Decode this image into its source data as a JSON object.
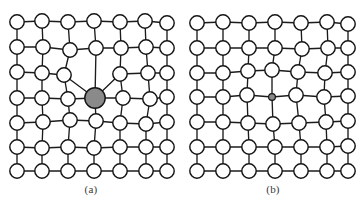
{
  "figure": {
    "background_color": "#ffffff",
    "bond_color": "#1c1c1c",
    "atom_fill_color": "#ffffff",
    "atom_stroke_color": "#141414",
    "impurity_fill_color": "#8a8a8a",
    "caption_color": "#38383c"
  },
  "panels": [
    {
      "id": "a",
      "caption": "(a)",
      "defect_type": "large-substitutional-impurity",
      "rows": 7,
      "cols": 7,
      "atom_radius": 7.2,
      "impurity": {
        "row": 3,
        "col": 3,
        "cx": 95,
        "cy": 98,
        "r": 10.2,
        "fill": "#8a8a8a"
      },
      "nodes": [
        [
          17,
          22
        ],
        [
          42,
          21
        ],
        [
          68,
          22
        ],
        [
          94,
          21
        ],
        [
          120,
          22
        ],
        [
          145,
          21
        ],
        [
          167,
          23
        ],
        [
          17,
          47
        ],
        [
          43,
          47
        ],
        [
          70,
          50
        ],
        [
          96,
          48
        ],
        [
          121,
          48
        ],
        [
          146,
          47
        ],
        [
          167,
          48
        ],
        [
          17,
          72
        ],
        [
          42,
          73
        ],
        [
          64,
          75
        ],
        [
          95,
          98
        ],
        [
          120,
          74
        ],
        [
          148,
          73
        ],
        [
          167,
          73
        ],
        [
          17,
          98
        ],
        [
          42,
          98
        ],
        [
          68,
          99
        ],
        [
          95,
          98
        ],
        [
          123,
          98
        ],
        [
          150,
          99
        ],
        [
          167,
          97
        ],
        [
          17,
          123
        ],
        [
          43,
          122
        ],
        [
          70,
          120
        ],
        [
          96,
          121
        ],
        [
          120,
          123
        ],
        [
          146,
          124
        ],
        [
          167,
          122
        ],
        [
          17,
          147
        ],
        [
          42,
          148
        ],
        [
          68,
          147
        ],
        [
          94,
          148
        ],
        [
          120,
          147
        ],
        [
          146,
          147
        ],
        [
          167,
          147
        ],
        [
          17,
          171
        ],
        [
          42,
          171
        ],
        [
          68,
          171
        ],
        [
          94,
          171
        ],
        [
          120,
          171
        ],
        [
          146,
          171
        ],
        [
          167,
          171
        ]
      ]
    },
    {
      "id": "b",
      "caption": "(b)",
      "defect_type": "small-substitutional-impurity",
      "rows": 7,
      "cols": 7,
      "atom_radius": 7.2,
      "impurity": {
        "row": 3,
        "col": 3,
        "cx": 90,
        "cy": 97,
        "r": 3.4,
        "fill": "#8a8a8a"
      },
      "nodes": [
        [
          15,
          23
        ],
        [
          41,
          22
        ],
        [
          67,
          23
        ],
        [
          93,
          22
        ],
        [
          119,
          23
        ],
        [
          145,
          22
        ],
        [
          166,
          24
        ],
        [
          15,
          48
        ],
        [
          41,
          48
        ],
        [
          67,
          48
        ],
        [
          93,
          48
        ],
        [
          120,
          49
        ],
        [
          146,
          48
        ],
        [
          166,
          48
        ],
        [
          15,
          73
        ],
        [
          41,
          73
        ],
        [
          66,
          71
        ],
        [
          90,
          70
        ],
        [
          116,
          72
        ],
        [
          143,
          73
        ],
        [
          166,
          72
        ],
        [
          15,
          97
        ],
        [
          41,
          97
        ],
        [
          65,
          95
        ],
        [
          90,
          97
        ],
        [
          114,
          95
        ],
        [
          142,
          97
        ],
        [
          166,
          96
        ],
        [
          15,
          122
        ],
        [
          41,
          122
        ],
        [
          66,
          123
        ],
        [
          91,
          124
        ],
        [
          117,
          123
        ],
        [
          144,
          122
        ],
        [
          166,
          121
        ],
        [
          15,
          147
        ],
        [
          41,
          147
        ],
        [
          67,
          147
        ],
        [
          93,
          147
        ],
        [
          119,
          147
        ],
        [
          145,
          147
        ],
        [
          166,
          146
        ],
        [
          15,
          171
        ],
        [
          41,
          171
        ],
        [
          67,
          171
        ],
        [
          93,
          171
        ],
        [
          119,
          171
        ],
        [
          145,
          171
        ],
        [
          166,
          171
        ]
      ]
    }
  ]
}
